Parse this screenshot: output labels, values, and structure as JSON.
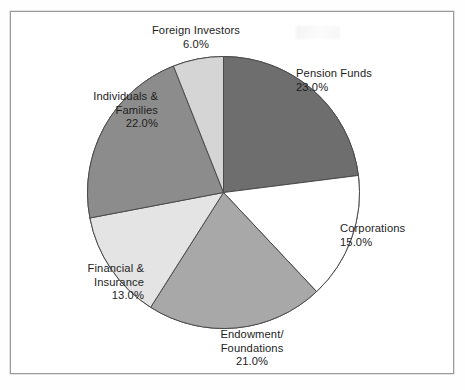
{
  "figure": {
    "background_color": "#ffffff",
    "frame_color": "#9a9a9a"
  },
  "chart_data": {
    "type": "pie",
    "title": "",
    "subtitle": "",
    "xlabel": "",
    "ylabel": "",
    "legend_position": "none",
    "grid": false,
    "label_format": "name + percent",
    "start_angle_deg": 0,
    "direction": "clockwise",
    "categories": [
      "Pension Funds",
      "Corporations",
      "Endowment/ Foundations",
      "Financial & Insurance",
      "Individuals & Families",
      "Foreign Investors"
    ],
    "values": [
      23.0,
      15.0,
      21.0,
      13.0,
      22.0,
      6.0
    ],
    "value_labels": [
      "23.0%",
      "15.0%",
      "21.0%",
      "13.0%",
      "22.0%",
      "6.0%"
    ],
    "colors": [
      "#6e6e6e",
      "#ffffff",
      "#a8a8a8",
      "#e4e4e4",
      "#8c8c8c",
      "#d5d5d5"
    ],
    "slice_edge_color": "#4a4a4a",
    "total": 100.0
  },
  "labels": {
    "foreign": {
      "name": "Foreign Investors",
      "pct": "6.0%"
    },
    "pension": {
      "name": "Pension Funds",
      "pct": "23.0%"
    },
    "corporations": {
      "name": "Corporations",
      "pct": "15.0%"
    },
    "endowment": {
      "name_line1": "Endowment/",
      "name_line2": "Foundations",
      "pct": "21.0%"
    },
    "financial": {
      "name_line1": "Financial &",
      "name_line2": "Insurance",
      "pct": "13.0%"
    },
    "individuals": {
      "name_line1": "Individuals &",
      "name_line2": "Families",
      "pct": "22.0%"
    }
  }
}
